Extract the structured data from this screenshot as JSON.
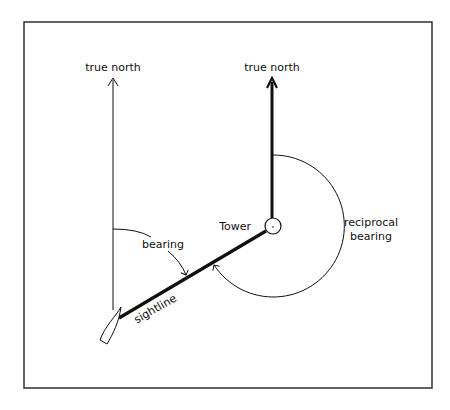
{
  "diagram": {
    "labels": {
      "left_north": "true north",
      "right_north": "true north",
      "tower": "Tower",
      "bearing": "bearing",
      "reciprocal_line1": "reciprocal",
      "reciprocal_line2": "bearing",
      "sightline": "sightline"
    },
    "colors": {
      "stroke": "#111111",
      "background": "#ffffff"
    }
  }
}
